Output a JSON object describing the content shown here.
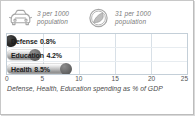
{
  "panel": {
    "border_color": "#c8c8c8",
    "background": "#ffffff"
  },
  "stats": [
    {
      "icon": "car-icon",
      "value": "3",
      "text": "3 per 1000\npopulation",
      "line1": "3 per 1000",
      "line2": "population"
    },
    {
      "icon": "telephone-dial-icon",
      "value": "31",
      "text": "31 per 1000\npopulation",
      "line1": "31 per 1000",
      "line2": "population"
    }
  ],
  "chart_data": {
    "type": "bar",
    "orientation": "horizontal",
    "title": "",
    "caption": "Defense, Health, Education spending as % of GDP",
    "xlabel": "",
    "ylabel": "",
    "xlim": [
      0,
      25
    ],
    "xticks": [
      "0",
      "5",
      "10",
      "15",
      "20",
      "25"
    ],
    "xtick_values": [
      0,
      5,
      10,
      15,
      20,
      25
    ],
    "grid": true,
    "grid_axis": "x",
    "legend": false,
    "categories": [
      "Defense",
      "Education",
      "Health"
    ],
    "values": [
      0.8,
      4.2,
      8.5
    ],
    "bars": [
      {
        "label": "Defense",
        "value": 0.8,
        "value_label": "0.8%",
        "cap": "dark"
      },
      {
        "label": "Education",
        "value": 4.2,
        "value_label": "4.2%",
        "cap": "light"
      },
      {
        "label": "Health",
        "value": 8.5,
        "value_label": "8.5%",
        "cap": "light"
      }
    ],
    "colors": {
      "bar_fill_light": "#e6e6e6",
      "bar_fill_dark": "#8f8f8f",
      "cap_dark": "#111111",
      "gridline": "#d8e0e7",
      "plot_border": "#c4cfd8",
      "label_text": "#1c1c1c",
      "tick_text": "#555555",
      "caption_text": "#4a4a4a",
      "stat_text": "#7b7b7b"
    }
  }
}
